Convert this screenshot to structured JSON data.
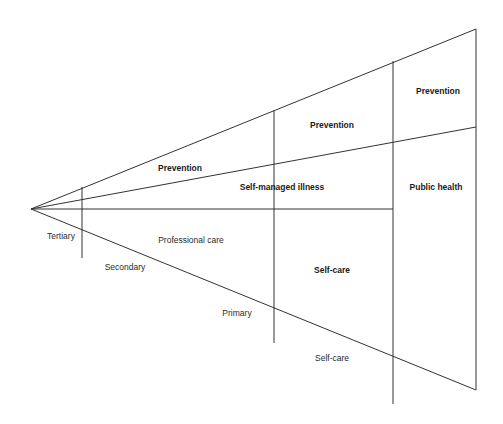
{
  "diagram": {
    "type": "care-spectrum-wedge",
    "line_color": "#333333",
    "apex": [
      31,
      209
    ],
    "lines": [
      {
        "id": "upper-diagonal",
        "x1": 31,
        "y1": 209,
        "x2": 476,
        "y2": 29
      },
      {
        "id": "middle-diagonal",
        "x1": 31,
        "y1": 209,
        "x2": 476,
        "y2": 127
      },
      {
        "id": "horizontal-axis",
        "x1": 31,
        "y1": 209,
        "x2": 393,
        "y2": 209
      },
      {
        "id": "lower-diagonal",
        "x1": 31,
        "y1": 209,
        "x2": 476,
        "y2": 390
      },
      {
        "id": "divider-tertiary",
        "x1": 82,
        "y1": 187,
        "x2": 82,
        "y2": 258
      },
      {
        "id": "divider-primary",
        "x1": 274,
        "y1": 110,
        "x2": 274,
        "y2": 343
      },
      {
        "id": "divider-self-care",
        "x1": 393,
        "y1": 61,
        "x2": 393,
        "y2": 404
      },
      {
        "id": "right-edge",
        "x1": 476,
        "y1": 29,
        "x2": 476,
        "y2": 390
      }
    ],
    "labels": [
      {
        "id": "prevention-1",
        "text": "Prevention",
        "x": 180,
        "y": 168,
        "bold": true
      },
      {
        "id": "prevention-2",
        "text": "Prevention",
        "x": 332,
        "y": 125,
        "bold": true
      },
      {
        "id": "prevention-3",
        "text": "Prevention",
        "x": 438,
        "y": 91,
        "bold": true
      },
      {
        "id": "self-managed-illness",
        "text": "Self-managed illness",
        "x": 282,
        "y": 187,
        "bold": true
      },
      {
        "id": "public-health",
        "text": "Public health",
        "x": 436,
        "y": 187,
        "bold": true
      },
      {
        "id": "tertiary",
        "text": "Tertiary",
        "x": 61,
        "y": 236,
        "bold": false
      },
      {
        "id": "professional-care",
        "text": "Professional care",
        "x": 191,
        "y": 240,
        "bold": false
      },
      {
        "id": "secondary",
        "text": "Secondary",
        "x": 125,
        "y": 267,
        "bold": false
      },
      {
        "id": "self-care-bold",
        "text": "Self-care",
        "x": 332,
        "y": 270,
        "bold": true
      },
      {
        "id": "primary",
        "text": "Primary",
        "x": 237,
        "y": 313,
        "bold": false
      },
      {
        "id": "self-care",
        "text": "Self-care",
        "x": 332,
        "y": 358,
        "bold": false
      }
    ]
  }
}
